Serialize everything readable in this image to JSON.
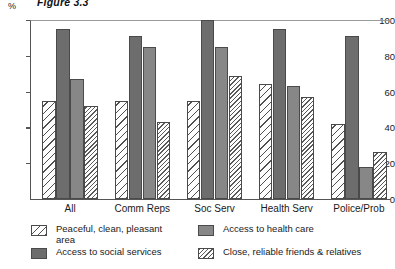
{
  "figure": {
    "title": "Figure 3.3",
    "y_unit": "%"
  },
  "chart_data": {
    "type": "bar",
    "title": "Figure 3.3",
    "xlabel": "",
    "ylabel": "%",
    "ylim": [
      0,
      100
    ],
    "yticks": [
      0,
      20,
      40,
      60,
      80,
      100
    ],
    "grid": false,
    "legend_position": "bottom",
    "categories": [
      "All",
      "Comm Reps",
      "Soc Serv",
      "Health Serv",
      "Police/Prob"
    ],
    "series": [
      {
        "name": "Peaceful, clean, pleasant area",
        "pattern": "diagonal-hatch",
        "color": "#fdfdfd",
        "values": [
          55,
          55,
          55,
          64,
          42
        ]
      },
      {
        "name": "Access to social services",
        "pattern": "solid",
        "color": "#6d6d6d",
        "values": [
          95,
          91,
          100,
          95,
          91
        ]
      },
      {
        "name": "Access to health care",
        "pattern": "solid",
        "color": "#878787",
        "values": [
          67,
          85,
          85,
          63,
          18
        ]
      },
      {
        "name": "Close, reliable friends & relatives",
        "pattern": "fine-dot-hatch",
        "color": "#fdfdfd",
        "values": [
          52,
          43,
          69,
          57,
          26
        ]
      }
    ]
  },
  "legend": {
    "items": [
      "Peaceful, clean, pleasant\narea",
      "Access to social services",
      "Access to health care",
      "Close, reliable friends & relatives"
    ]
  }
}
